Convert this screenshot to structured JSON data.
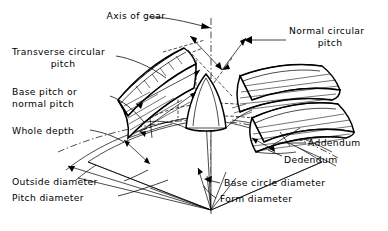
{
  "figure": {
    "ink_color": "#000000",
    "background_color": "#ffffff"
  },
  "labels": {
    "axis_of_gear": "Axis of gear",
    "normal_circular_pitch_line1": "Normal circular",
    "normal_circular_pitch_line2": "pitch",
    "transverse_circular_pitch_line1": "Transverse circular",
    "transverse_circular_pitch_line2": "pitch",
    "base_pitch_line1": "Base pitch or",
    "base_pitch_line2": "normal pitch",
    "whole_depth": "Whole depth",
    "addendum": "Addendum",
    "dedendum": "Dedendum",
    "outside_diameter": "Outside diameter",
    "pitch_diameter": "Pitch diameter",
    "base_circle_diameter": "Base circle diameter",
    "form_diameter": "Form diameter"
  }
}
